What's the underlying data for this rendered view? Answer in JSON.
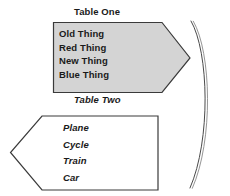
{
  "diagram": {
    "background_color": "#ffffff",
    "outline_color": "#3a3a3a",
    "shape_one": {
      "name": "Table One",
      "title": "Table One",
      "fill_color": "#d4d4d4",
      "stroke_color": "#3a3a3a",
      "shape_kind": "right-pointing-pentagon-arrow",
      "items": [
        "Old Thing",
        "Red Thing",
        "New Thing",
        "Blue Thing"
      ]
    },
    "shape_two": {
      "name": "Table Two",
      "title": "Table Two",
      "fill_color": "#ffffff",
      "stroke_color": "#3a3a3a",
      "shape_kind": "left-pointing-pentagon-arrow",
      "items": [
        "Plane",
        "Cycle",
        "Train",
        "Car"
      ]
    },
    "connector": {
      "name": "curved-arc-bracket",
      "stroke_color": "#4a4a4a",
      "style": "double-thin-arc"
    }
  }
}
